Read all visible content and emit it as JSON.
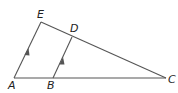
{
  "diagram": {
    "type": "geometry-triangle",
    "stroke_color": "#555555",
    "label_color": "#222222",
    "points": {
      "A": {
        "x": 14,
        "y": 78,
        "label": "A",
        "lx": 8,
        "ly": 89
      },
      "B": {
        "x": 53,
        "y": 78,
        "label": "B",
        "lx": 47,
        "ly": 89
      },
      "C": {
        "x": 166,
        "y": 78,
        "label": "C",
        "lx": 168,
        "ly": 83
      },
      "D": {
        "x": 72,
        "y": 37,
        "label": "D",
        "lx": 70,
        "ly": 32
      },
      "E": {
        "x": 41,
        "y": 22,
        "label": "E",
        "lx": 37,
        "ly": 18
      }
    },
    "segments": [
      "AE",
      "EC",
      "AC",
      "BD"
    ],
    "parallel_marks": [
      "AE",
      "BD"
    ]
  }
}
